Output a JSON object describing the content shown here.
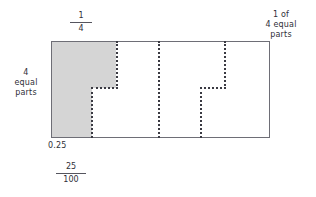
{
  "figure": {
    "title_alt": "Rectangle partitioned into 4 equal parts with one part shaded",
    "labels": {
      "top_fraction": {
        "numerator": "1",
        "denominator": "4"
      },
      "top_right": {
        "line1": "1 of",
        "line2": "4 equal",
        "line3": "parts"
      },
      "left": {
        "line1": "4",
        "line2": "equal",
        "line3": "parts"
      },
      "bottom_decimal": "0.25",
      "bottom_fraction": {
        "numerator": "25",
        "denominator": "100"
      }
    },
    "colors": {
      "shaded_fill": "#d5d5d5",
      "outline": "#6e6e76",
      "dotted_line": "#3a3a42",
      "background": "#ffffff",
      "text": "#2f2f38"
    }
  },
  "chart_data": {
    "type": "area",
    "xlabel": "",
    "ylabel": "",
    "categories": [
      "part 1",
      "part 2",
      "part 3",
      "part 4"
    ],
    "values": [
      1,
      0,
      0,
      0
    ],
    "total_parts": 4,
    "shaded_parts": 1,
    "equivalent_values": {
      "fraction": "1/4",
      "decimal": "0.25",
      "fraction_hundredths": "25/100",
      "percent": "25%"
    },
    "annotations": [
      "1/4",
      "1 of 4 equal parts",
      "4 equal parts",
      "0.25",
      "25/100"
    ],
    "grid": false,
    "legend": "none"
  }
}
